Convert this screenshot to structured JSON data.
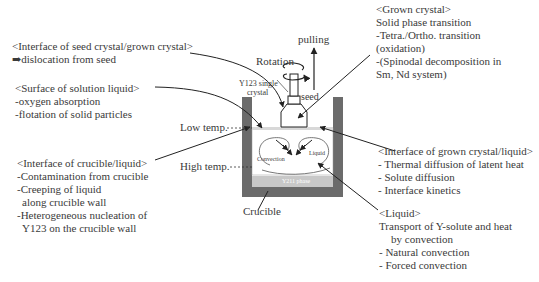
{
  "blocks": {
    "seed_interface": {
      "title": "<Interface of seed crystal/grown crystal>",
      "lines": [
        "➡dislocation from seed"
      ]
    },
    "surface": {
      "title": "<Surface of solution liquid>",
      "lines": [
        "-oxygen absorption",
        "-flotation of solid particles"
      ]
    },
    "crucible_interface": {
      "title": "<Interface of crucible/liquid>",
      "lines": [
        "-Contamination from crucible",
        "-Creeping of liquid",
        "  along crucible wall",
        "-Heterogeneous nucleation of",
        "  Y123 on the crucible wall"
      ]
    },
    "grown_crystal": {
      "title": "<Grown crystal>",
      "lines": [
        "Solid phase transition",
        "-Tetra./Ortho. transition",
        "(oxidation)",
        "-(Spinodal decomposition in",
        "Sm, Nd system)"
      ]
    },
    "growth_interface": {
      "title": "<Interface of grown crystal/liquid>",
      "lines": [
        "- Thermal diffusion of latent heat",
        "- Solute diffusion",
        "- Interface kinetics"
      ]
    },
    "liquid": {
      "title": "<Liquid>",
      "lines": [
        "Transport of Y-solute and heat",
        "    by convection",
        "- Natural convection",
        "- Forced convection"
      ]
    }
  },
  "labels": {
    "rotation": "Rotation",
    "pulling": "pulling",
    "y123_single": "Y123 single",
    "crystal": "crystal",
    "seed": "seed",
    "low_temp": "Low temp.",
    "high_temp": "High temp.",
    "convection": "Convection",
    "liquid": "Liquid",
    "y211": "Y211 phase",
    "crucible": "Crucible"
  },
  "colors": {
    "crucible_wall": "#6b6b6b",
    "y211_layer": "#c8c8c8",
    "line": "#222222"
  }
}
